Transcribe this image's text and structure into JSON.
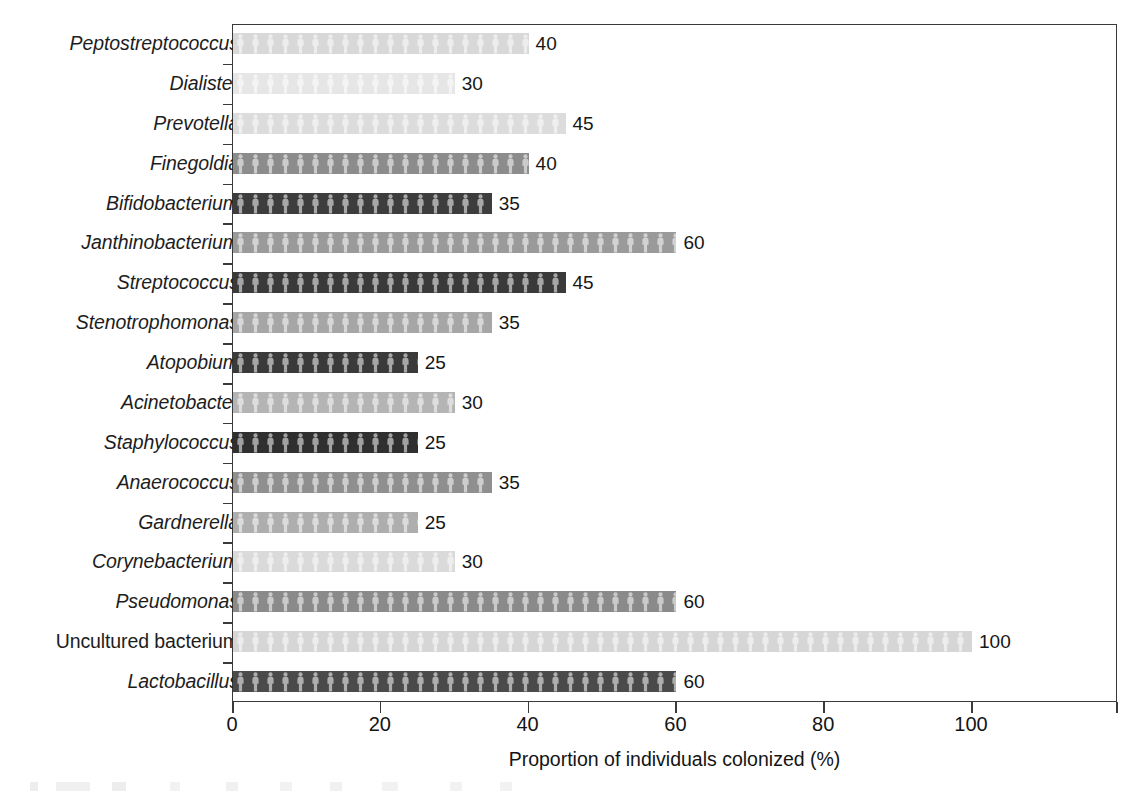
{
  "chart_data": {
    "type": "bar",
    "orientation": "horizontal",
    "title": "",
    "xlabel": "Proportion of individuals colonized (%)",
    "ylabel": "",
    "xlim": [
      0,
      120
    ],
    "xticks": [
      0,
      20,
      40,
      60,
      80,
      100
    ],
    "xtick_labels": [
      "0",
      "20",
      "40",
      "60",
      "80",
      "100"
    ],
    "minor_xticks": [
      120
    ],
    "grid": false,
    "legend": "none",
    "value_labels_shown": true,
    "categories": [
      "Peptostreptococcus",
      "Dialister",
      "Prevotella",
      "Finegoldia",
      "Bifidobacterium",
      "Janthinobacterium",
      "Streptococcus",
      "Stenotrophomonas",
      "Atopobium",
      "Acinetobacter",
      "Staphylococcus",
      "Anaerococcus",
      "Gardnerella",
      "Corynebacterium",
      "Pseudomonas",
      "Uncultured bacterium",
      "Lactobacillus"
    ],
    "values": [
      40,
      30,
      45,
      40,
      35,
      60,
      45,
      35,
      25,
      30,
      25,
      35,
      25,
      30,
      60,
      100,
      60
    ],
    "bars": [
      {
        "category": "Peptostreptococcus",
        "value": 40,
        "label": "40",
        "shade": "#d8d8d8",
        "italic": true
      },
      {
        "category": "Dialister",
        "value": 30,
        "label": "30",
        "shade": "#e6e6e6",
        "italic": true
      },
      {
        "category": "Prevotella",
        "value": 45,
        "label": "45",
        "shade": "#dcdcdc",
        "italic": true
      },
      {
        "category": "Finegoldia",
        "value": 40,
        "label": "40",
        "shade": "#8c8c8c",
        "italic": true
      },
      {
        "category": "Bifidobacterium",
        "value": 35,
        "label": "35",
        "shade": "#3d3d3d",
        "italic": true
      },
      {
        "category": "Janthinobacterium",
        "value": 60,
        "label": "60",
        "shade": "#9a9a9a",
        "italic": true
      },
      {
        "category": "Streptococcus",
        "value": 45,
        "label": "45",
        "shade": "#3a3a3a",
        "italic": true
      },
      {
        "category": "Stenotrophomonas",
        "value": 35,
        "label": "35",
        "shade": "#a6a6a6",
        "italic": true
      },
      {
        "category": "Atopobium",
        "value": 25,
        "label": "25",
        "shade": "#3a3a3a",
        "italic": true
      },
      {
        "category": "Acinetobacter",
        "value": 30,
        "label": "30",
        "shade": "#b4b4b4",
        "italic": true
      },
      {
        "category": "Staphylococcus",
        "value": 25,
        "label": "25",
        "shade": "#2f2f2f",
        "italic": true
      },
      {
        "category": "Anaerococcus",
        "value": 35,
        "label": "35",
        "shade": "#8f8f8f",
        "italic": true
      },
      {
        "category": "Gardnerella",
        "value": 25,
        "label": "25",
        "shade": "#aeaeae",
        "italic": true
      },
      {
        "category": "Corynebacterium",
        "value": 30,
        "label": "30",
        "shade": "#dadada",
        "italic": true
      },
      {
        "category": "Pseudomonas",
        "value": 60,
        "label": "60",
        "shade": "#8a8a8a",
        "italic": true
      },
      {
        "category": "Uncultured bacterium",
        "value": 100,
        "label": "100",
        "shade": "#d6d6d6",
        "italic": false
      },
      {
        "category": "Lactobacillus",
        "value": 60,
        "label": "60",
        "shade": "#4a4a4a",
        "italic": true
      }
    ]
  },
  "axis": {
    "x_title": "Proportion of individuals colonized (%)",
    "tick_labels": [
      "0",
      "20",
      "40",
      "60",
      "80",
      "100"
    ]
  }
}
